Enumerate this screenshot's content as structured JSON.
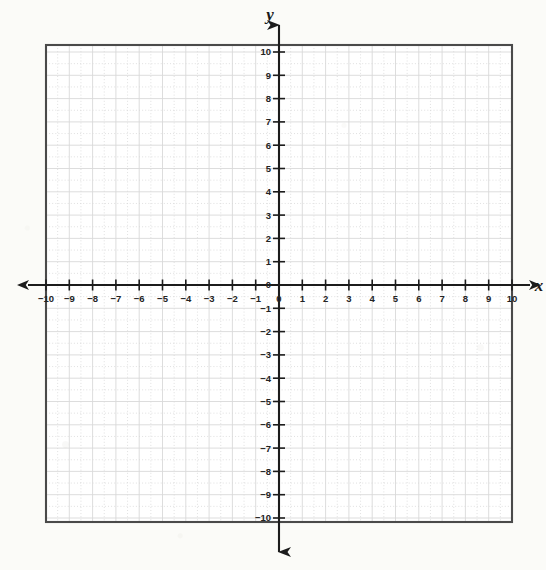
{
  "figure": {
    "kind": "cartesian-coordinate-grid",
    "background_color": "#fbfbf8",
    "frame_color": "#4a4a4a",
    "axis_color": "#1c1c1c",
    "major_grid_color": "#d7d7d7",
    "minor_grid_color": "#cfcfcf",
    "tick_label_color": "#232323"
  },
  "axes": {
    "x": {
      "label": "x",
      "min": -10,
      "max": 10,
      "tick_step": 1,
      "minor_per_major": 2,
      "arrow_start": true,
      "arrow_end": true,
      "tick_labels": [
        "-10",
        "-9",
        "-8",
        "-7",
        "-6",
        "-5",
        "-4",
        "-3",
        "-2",
        "-1",
        "0",
        "1",
        "2",
        "3",
        "4",
        "5",
        "6",
        "7",
        "8",
        "9",
        "10"
      ]
    },
    "y": {
      "label": "y",
      "min": -10,
      "max": 10,
      "tick_step": 1,
      "minor_per_major": 2,
      "arrow_start": true,
      "arrow_end": true,
      "tick_labels": [
        "10",
        "9",
        "8",
        "7",
        "6",
        "5",
        "4",
        "3",
        "2",
        "1",
        "0",
        "-1",
        "-2",
        "-3",
        "-4",
        "-5",
        "-6",
        "-7",
        "-8",
        "-9",
        "-10"
      ]
    }
  },
  "origin_label": "0",
  "geometry": {
    "frame_left": 46,
    "frame_top": 45,
    "frame_right": 512,
    "frame_bottom": 522,
    "origin_x": 279,
    "origin_y": 285,
    "unit_px": 23.3
  },
  "chart_data": {
    "type": "scatter",
    "title": "",
    "xlabel": "x",
    "ylabel": "y",
    "xlim": [
      -10,
      10
    ],
    "ylim": [
      -10,
      10
    ],
    "grid": true,
    "legend": "none",
    "series": [],
    "x": [],
    "values": [],
    "note": "Empty blank coordinate plane; no plotted data points or curves."
  }
}
